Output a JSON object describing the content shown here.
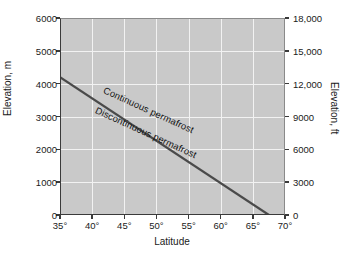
{
  "chart_data": {
    "type": "line",
    "title": "",
    "xlabel": "Latitude",
    "ylabel": "Elevation, m",
    "ylabel_secondary": "Elevation, ft",
    "xlim": [
      35,
      70
    ],
    "ylim": [
      0,
      6000
    ],
    "ylim_secondary": [
      0,
      18000
    ],
    "grid": true,
    "legend": "none",
    "xticks": [
      35,
      40,
      45,
      50,
      55,
      60,
      65,
      70
    ],
    "xticklabels": [
      "35°",
      "40°",
      "45°",
      "50°",
      "55°",
      "60°",
      "65°",
      "70°"
    ],
    "yticks": [
      0,
      1000,
      2000,
      3000,
      4000,
      5000,
      6000
    ],
    "yticklabels": [
      "0",
      "1000",
      "2000",
      "3000",
      "4000",
      "5000",
      "6000"
    ],
    "yticks_secondary": [
      0,
      3000,
      6000,
      9000,
      12000,
      15000,
      18000
    ],
    "yticklabels_secondary": [
      "0",
      "3000",
      "6000",
      "9000",
      "12,000",
      "15,000",
      "18,000"
    ],
    "series": [
      {
        "name": "permafrost boundary",
        "x": [
          35,
          67.5
        ],
        "values": [
          4200,
          0
        ],
        "color": "#4a4a4a"
      }
    ],
    "annotations": [
      {
        "text": "Continuous permafrost",
        "region": "above-line"
      },
      {
        "text": "Discontinuous permafrost",
        "region": "below-line"
      }
    ],
    "colors": {
      "plot_background": "#c9c9c9",
      "gridline": "#f2f2f2",
      "axis": "#3a3a3a",
      "line": "#4a4a4a",
      "page_background": "#ffffff",
      "text": "#1a1a1a"
    }
  }
}
